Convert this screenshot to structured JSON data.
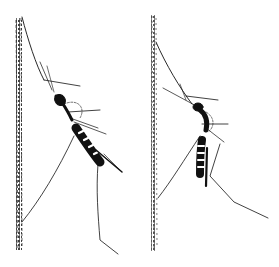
{
  "figure": {
    "colors": {
      "ink": "#111111",
      "background": "#ffffff"
    },
    "panels": [
      {
        "name": "left-mosquito",
        "pose": "body angled diagonally, head up near surface"
      },
      {
        "name": "right-mosquito",
        "pose": "body more vertical, hanging from surface"
      }
    ]
  }
}
